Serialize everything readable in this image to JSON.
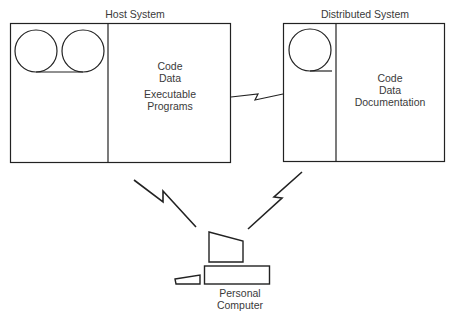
{
  "host": {
    "title": "Host System",
    "contents": [
      "Code",
      "Data"
    ],
    "contents2": [
      "Executable",
      "Programs"
    ]
  },
  "distributed": {
    "title": "Distributed System",
    "contents": [
      "Code",
      "Data",
      "Documentation"
    ]
  },
  "pc": {
    "label_line1": "Personal",
    "label_line2": "Computer"
  },
  "icons": [
    "tape-drive-icon",
    "lightning-link-icon",
    "personal-computer-icon"
  ]
}
